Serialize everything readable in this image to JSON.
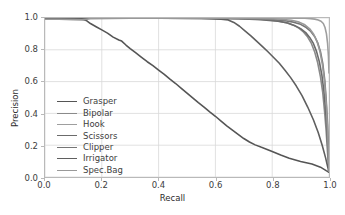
{
  "chart_data": {
    "type": "line",
    "title": "",
    "xlabel": "Recall",
    "ylabel": "Precision",
    "xlim": [
      0.0,
      1.0
    ],
    "ylim": [
      0.0,
      1.0
    ],
    "xticks": [
      "0.0",
      "0.2",
      "0.4",
      "0.6",
      "0.8",
      "1.0"
    ],
    "yticks": [
      "0.0",
      "0.2",
      "0.4",
      "0.6",
      "0.8",
      "1.0"
    ],
    "xtick_values": [
      0.0,
      0.2,
      0.4,
      0.6,
      0.8,
      1.0
    ],
    "ytick_values": [
      0.0,
      0.2,
      0.4,
      0.6,
      0.8,
      1.0
    ],
    "grid": true,
    "legend_position": "lower left",
    "legend_frame": false,
    "series": [
      {
        "name": "Grasper",
        "color": "#555555",
        "x": [
          0.0,
          0.02,
          0.05,
          0.08,
          0.11,
          0.13,
          0.145,
          0.16,
          0.18,
          0.2,
          0.22,
          0.24,
          0.26,
          0.27,
          0.285,
          0.3,
          0.32,
          0.34,
          0.36,
          0.38,
          0.4,
          0.42,
          0.44,
          0.46,
          0.48,
          0.5,
          0.52,
          0.54,
          0.56,
          0.58,
          0.6,
          0.62,
          0.64,
          0.66,
          0.68,
          0.7,
          0.72,
          0.74,
          0.76,
          0.78,
          0.8,
          0.83,
          0.86,
          0.9,
          0.94,
          0.97,
          0.99,
          1.0
        ],
        "y": [
          0.995,
          0.995,
          0.995,
          0.995,
          0.994,
          0.992,
          0.985,
          0.965,
          0.945,
          0.925,
          0.905,
          0.88,
          0.862,
          0.855,
          0.83,
          0.808,
          0.78,
          0.752,
          0.725,
          0.7,
          0.672,
          0.645,
          0.615,
          0.588,
          0.558,
          0.528,
          0.498,
          0.468,
          0.44,
          0.41,
          0.382,
          0.352,
          0.322,
          0.295,
          0.268,
          0.242,
          0.22,
          0.202,
          0.188,
          0.175,
          0.16,
          0.138,
          0.118,
          0.098,
          0.082,
          0.062,
          0.04,
          0.03
        ]
      },
      {
        "name": "Bipolar",
        "color": "#8a8a8a",
        "x": [
          0.0,
          0.2,
          0.4,
          0.55,
          0.65,
          0.72,
          0.78,
          0.82,
          0.85,
          0.875,
          0.895,
          0.91,
          0.925,
          0.938,
          0.95,
          0.96,
          0.97,
          0.978,
          0.985,
          0.99,
          0.995,
          1.0
        ],
        "y": [
          1.0,
          1.0,
          1.0,
          0.999,
          0.998,
          0.996,
          0.99,
          0.982,
          0.97,
          0.955,
          0.935,
          0.912,
          0.88,
          0.84,
          0.785,
          0.72,
          0.63,
          0.53,
          0.4,
          0.29,
          0.15,
          0.035
        ]
      },
      {
        "name": "Hook",
        "color": "#9e9e9e",
        "x": [
          0.0,
          0.25,
          0.5,
          0.7,
          0.82,
          0.88,
          0.915,
          0.935,
          0.95,
          0.962,
          0.972,
          0.98,
          0.986,
          0.991,
          0.995,
          0.998,
          1.0
        ],
        "y": [
          1.0,
          1.0,
          1.0,
          1.0,
          1.0,
          0.999,
          0.998,
          0.996,
          0.993,
          0.988,
          0.98,
          0.965,
          0.94,
          0.9,
          0.84,
          0.76,
          0.655
        ]
      },
      {
        "name": "Scissors",
        "color": "#6b6b6b",
        "x": [
          0.0,
          0.2,
          0.42,
          0.58,
          0.68,
          0.76,
          0.82,
          0.855,
          0.88,
          0.9,
          0.918,
          0.932,
          0.945,
          0.956,
          0.966,
          0.975,
          0.982,
          0.988,
          0.993,
          0.997,
          1.0
        ],
        "y": [
          0.998,
          0.998,
          0.998,
          0.997,
          0.995,
          0.99,
          0.98,
          0.968,
          0.952,
          0.933,
          0.908,
          0.878,
          0.84,
          0.79,
          0.725,
          0.64,
          0.54,
          0.42,
          0.29,
          0.145,
          0.03
        ]
      },
      {
        "name": "Clipper",
        "color": "#757575",
        "x": [
          0.0,
          0.22,
          0.45,
          0.6,
          0.7,
          0.78,
          0.84,
          0.875,
          0.9,
          0.92,
          0.936,
          0.95,
          0.961,
          0.97,
          0.978,
          0.985,
          0.99,
          0.995,
          0.998,
          1.0
        ],
        "y": [
          1.0,
          1.0,
          0.999,
          0.998,
          0.996,
          0.992,
          0.984,
          0.974,
          0.96,
          0.94,
          0.915,
          0.882,
          0.84,
          0.788,
          0.715,
          0.61,
          0.49,
          0.33,
          0.17,
          0.08
        ]
      },
      {
        "name": "Irrigator",
        "color": "#5f5f5f",
        "x": [
          0.0,
          0.2,
          0.4,
          0.55,
          0.62,
          0.645,
          0.665,
          0.685,
          0.705,
          0.725,
          0.745,
          0.765,
          0.785,
          0.805,
          0.825,
          0.845,
          0.865,
          0.885,
          0.905,
          0.925,
          0.945,
          0.962,
          0.976,
          0.988,
          0.996,
          1.0
        ],
        "y": [
          0.998,
          0.998,
          0.998,
          0.997,
          0.993,
          0.988,
          0.972,
          0.948,
          0.918,
          0.888,
          0.855,
          0.822,
          0.788,
          0.752,
          0.715,
          0.672,
          0.625,
          0.572,
          0.512,
          0.44,
          0.36,
          0.28,
          0.2,
          0.12,
          0.06,
          0.03
        ]
      },
      {
        "name": "Spec.Bag",
        "color": "#999999",
        "x": [
          0.0,
          0.05,
          0.1,
          0.13,
          0.16,
          0.3,
          0.5,
          0.65,
          0.75,
          0.82,
          0.868,
          0.895,
          0.915,
          0.932,
          0.946,
          0.958,
          0.968,
          0.977,
          0.985,
          0.991,
          0.996,
          1.0
        ],
        "y": [
          0.992,
          0.992,
          0.99,
          0.988,
          0.996,
          0.998,
          0.998,
          0.998,
          0.997,
          0.994,
          0.986,
          0.974,
          0.957,
          0.932,
          0.898,
          0.852,
          0.79,
          0.705,
          0.59,
          0.44,
          0.25,
          0.035
        ]
      }
    ]
  },
  "legend": {
    "items": [
      {
        "label": "Grasper"
      },
      {
        "label": "Bipolar"
      },
      {
        "label": "Hook"
      },
      {
        "label": "Scissors"
      },
      {
        "label": "Clipper"
      },
      {
        "label": "Irrigator"
      },
      {
        "label": "Spec.Bag"
      }
    ]
  }
}
